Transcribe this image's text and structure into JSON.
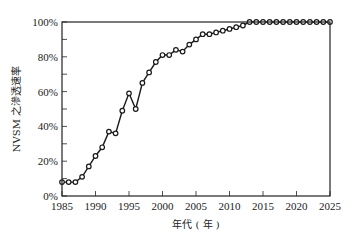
{
  "chart_data": {
    "type": "line",
    "title": "",
    "xlabel": "年代 ( 年 )",
    "ylabel": "NVSM 之滲透速率",
    "xlim": [
      1985,
      2025
    ],
    "ylim": [
      0,
      100
    ],
    "x_ticks": [
      "1985",
      "1990",
      "1995",
      "2000",
      "2005",
      "2010",
      "2015",
      "2020",
      "2025"
    ],
    "y_ticks": [
      "0%",
      "20%",
      "40%",
      "60%",
      "80%",
      "100%"
    ],
    "y_minor_step": 10,
    "grid": false,
    "legend": null,
    "marker": "open-circle",
    "series": [
      {
        "name": "NVSM penetration rate",
        "color": "#1a1a1a",
        "x": [
          1985,
          1986,
          1987,
          1988,
          1989,
          1990,
          1991,
          1992,
          1993,
          1994,
          1995,
          1996,
          1997,
          1998,
          1999,
          2000,
          2001,
          2002,
          2003,
          2004,
          2005,
          2006,
          2007,
          2008,
          2009,
          2010,
          2011,
          2012,
          2013,
          2014,
          2015,
          2016,
          2017,
          2018,
          2019,
          2020,
          2021,
          2022,
          2023,
          2024,
          2025
        ],
        "values": [
          8,
          8,
          8,
          11,
          17,
          23,
          28,
          37,
          36,
          49,
          59,
          50,
          65,
          71,
          77,
          81,
          81,
          84,
          83,
          87,
          90,
          93,
          93,
          94,
          95,
          96,
          97,
          98,
          100,
          100,
          100,
          100,
          100,
          100,
          100,
          100,
          100,
          100,
          100,
          100,
          100
        ]
      }
    ]
  }
}
